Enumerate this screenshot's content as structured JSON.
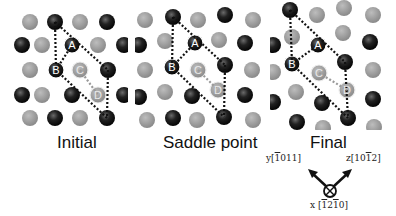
{
  "figure": {
    "panels": [
      {
        "id": "initial",
        "label": "Initial",
        "offset_x": 0,
        "atoms": [
          {
            "x": 30,
            "y": 22,
            "type": "gray"
          },
          {
            "x": 55,
            "y": 22,
            "type": "black"
          },
          {
            "x": 80,
            "y": 22,
            "type": "gray"
          },
          {
            "x": 107,
            "y": 22,
            "type": "black"
          },
          {
            "x": 22,
            "y": 45,
            "type": "black-half"
          },
          {
            "x": 42,
            "y": 45,
            "type": "gray"
          },
          {
            "x": 72,
            "y": 45,
            "type": "black",
            "tag": "A"
          },
          {
            "x": 98,
            "y": 45,
            "type": "gray"
          },
          {
            "x": 124,
            "y": 45,
            "type": "black"
          },
          {
            "x": 30,
            "y": 70,
            "type": "gray"
          },
          {
            "x": 56,
            "y": 70,
            "type": "black",
            "tag": "B"
          },
          {
            "x": 80,
            "y": 70,
            "type": "gray-ring",
            "tag": "C"
          },
          {
            "x": 108,
            "y": 70,
            "type": "black"
          },
          {
            "x": 22,
            "y": 95,
            "type": "black-half"
          },
          {
            "x": 42,
            "y": 95,
            "type": "gray"
          },
          {
            "x": 72,
            "y": 95,
            "type": "black"
          },
          {
            "x": 98,
            "y": 95,
            "type": "gray-ring",
            "tag": "D"
          },
          {
            "x": 124,
            "y": 95,
            "type": "black"
          },
          {
            "x": 30,
            "y": 118,
            "type": "gray"
          },
          {
            "x": 55,
            "y": 118,
            "type": "black"
          },
          {
            "x": 80,
            "y": 118,
            "type": "gray"
          },
          {
            "x": 107,
            "y": 118,
            "type": "black"
          }
        ],
        "black_lines": [
          [
            55,
            22,
            56,
            70
          ],
          [
            55,
            22,
            108,
            70
          ],
          [
            56,
            70,
            72,
            45
          ],
          [
            56,
            70,
            107,
            118
          ],
          [
            108,
            70,
            107,
            118
          ]
        ],
        "gray_lines": [
          [
            80,
            70,
            98,
            95
          ]
        ]
      },
      {
        "id": "saddle",
        "label": "Saddle point",
        "offset_x": 135,
        "atoms": [
          {
            "x": 10,
            "y": 20,
            "type": "gray"
          },
          {
            "x": 38,
            "y": 17,
            "type": "black"
          },
          {
            "x": 63,
            "y": 20,
            "type": "gray"
          },
          {
            "x": 90,
            "y": 15,
            "type": "black"
          },
          {
            "x": 118,
            "y": 20,
            "type": "gray"
          },
          {
            "x": 4,
            "y": 45,
            "type": "black-half"
          },
          {
            "x": 30,
            "y": 41,
            "type": "gray"
          },
          {
            "x": 60,
            "y": 43,
            "type": "black",
            "tag": "A"
          },
          {
            "x": 84,
            "y": 40,
            "type": "gray"
          },
          {
            "x": 110,
            "y": 43,
            "type": "black"
          },
          {
            "x": 10,
            "y": 70,
            "type": "gray"
          },
          {
            "x": 37,
            "y": 67,
            "type": "black",
            "tag": "B"
          },
          {
            "x": 63,
            "y": 70,
            "type": "gray-ring",
            "tag": "C"
          },
          {
            "x": 90,
            "y": 65,
            "type": "black"
          },
          {
            "x": 117,
            "y": 70,
            "type": "gray"
          },
          {
            "x": 4,
            "y": 97,
            "type": "black-half"
          },
          {
            "x": 30,
            "y": 92,
            "type": "gray"
          },
          {
            "x": 57,
            "y": 96,
            "type": "black"
          },
          {
            "x": 83,
            "y": 90,
            "type": "gray-ring",
            "tag": "D"
          },
          {
            "x": 110,
            "y": 95,
            "type": "black"
          },
          {
            "x": 12,
            "y": 120,
            "type": "gray"
          },
          {
            "x": 38,
            "y": 118,
            "type": "black"
          },
          {
            "x": 62,
            "y": 120,
            "type": "gray"
          },
          {
            "x": 89,
            "y": 117,
            "type": "black"
          },
          {
            "x": 118,
            "y": 120,
            "type": "gray"
          }
        ],
        "black_lines": [
          [
            38,
            17,
            37,
            67
          ],
          [
            38,
            17,
            90,
            65
          ],
          [
            37,
            67,
            60,
            43
          ],
          [
            37,
            67,
            89,
            117
          ],
          [
            90,
            65,
            89,
            117
          ]
        ],
        "gray_lines": [
          [
            63,
            70,
            83,
            90
          ]
        ]
      },
      {
        "id": "final",
        "label": "Final",
        "offset_x": 270,
        "atoms": [
          {
            "x": 20,
            "y": 10,
            "type": "black"
          },
          {
            "x": 47,
            "y": 15,
            "type": "gray"
          },
          {
            "x": 74,
            "y": 8,
            "type": "gray"
          },
          {
            "x": 103,
            "y": 15,
            "type": "gray"
          },
          {
            "x": 3,
            "y": 45,
            "type": "black-half"
          },
          {
            "x": 22,
            "y": 37,
            "type": "gray"
          },
          {
            "x": 48,
            "y": 45,
            "type": "black",
            "tag": "A"
          },
          {
            "x": 73,
            "y": 33,
            "type": "gray"
          },
          {
            "x": 100,
            "y": 42,
            "type": "black"
          },
          {
            "x": 3,
            "y": 72,
            "type": "gray-half"
          },
          {
            "x": 22,
            "y": 64,
            "type": "black",
            "tag": "B"
          },
          {
            "x": 49,
            "y": 73,
            "type": "gray-ring",
            "tag": "C"
          },
          {
            "x": 75,
            "y": 62,
            "type": "black"
          },
          {
            "x": 103,
            "y": 70,
            "type": "gray"
          },
          {
            "x": 3,
            "y": 102,
            "type": "black-half"
          },
          {
            "x": 26,
            "y": 92,
            "type": "gray"
          },
          {
            "x": 52,
            "y": 103,
            "type": "black"
          },
          {
            "x": 77,
            "y": 90,
            "type": "gray-ring",
            "tag": "D"
          },
          {
            "x": 103,
            "y": 99,
            "type": "black"
          },
          {
            "x": 27,
            "y": 122,
            "type": "black"
          },
          {
            "x": 53,
            "y": 128,
            "type": "gray"
          },
          {
            "x": 78,
            "y": 118,
            "type": "black"
          },
          {
            "x": 104,
            "y": 127,
            "type": "gray"
          }
        ],
        "black_lines": [
          [
            20,
            10,
            22,
            64
          ],
          [
            20,
            10,
            75,
            62
          ],
          [
            22,
            64,
            48,
            45
          ],
          [
            22,
            64,
            78,
            118
          ],
          [
            75,
            62,
            78,
            118
          ]
        ],
        "gray_lines": [
          [
            49,
            73,
            77,
            90
          ]
        ]
      }
    ],
    "labels": {
      "initial": "Initial",
      "saddle": "Saddle point",
      "final": "Final"
    },
    "axes": {
      "y_label": "y[1̄011]",
      "z_label": "z[101̄ 2]",
      "x_label": "x [1̄21̄0]"
    },
    "colors": {
      "gray_atom": "#9a9a9a",
      "black_atom": "#1a1a1a",
      "line": "#111111",
      "ring": "#e6e6e6"
    }
  }
}
